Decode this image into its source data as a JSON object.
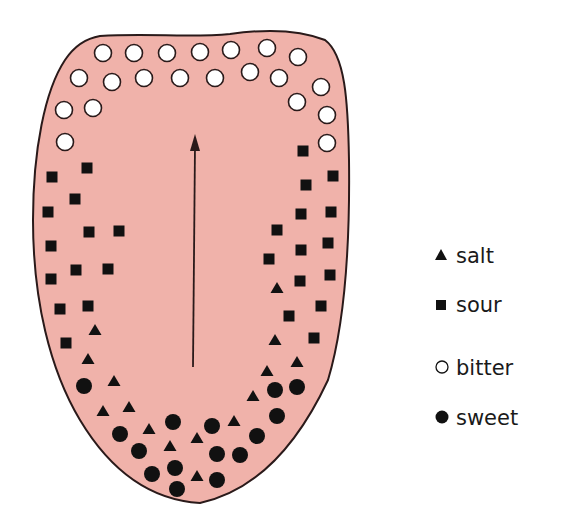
{
  "colors": {
    "tongue_fill": "#F0B2AA",
    "outline": "#2a1a1a",
    "marker": "#111111",
    "bitter_fill": "#ffffff"
  },
  "legend": [
    {
      "key": "salt",
      "label": "salt",
      "shape": "triangle-filled"
    },
    {
      "key": "sour",
      "label": "sour",
      "shape": "square-filled"
    },
    {
      "key": "bitter",
      "label": "bitter",
      "shape": "circle-open"
    },
    {
      "key": "sweet",
      "label": "sweet",
      "shape": "circle-filled"
    }
  ],
  "tongue_regions": {
    "bitter": "back of tongue (top of figure)",
    "sour": "sides",
    "salt": "front sides",
    "sweet": "tip (bottom of figure)"
  },
  "arrow": {
    "meaning": "direction from tip toward back of tongue"
  }
}
